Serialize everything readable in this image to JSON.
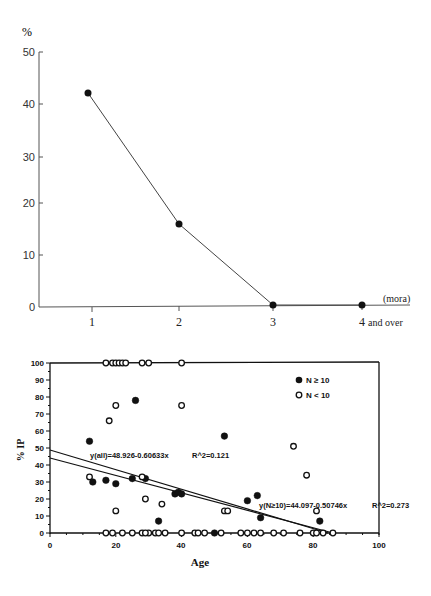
{
  "chart_data": [
    {
      "type": "line",
      "title": "",
      "xlabel": "(mora)",
      "ylabel": "%",
      "categories": [
        "1",
        "2",
        "3",
        "4 and over"
      ],
      "series": [
        {
          "name": "percentage",
          "values": [
            42,
            16,
            0,
            0
          ]
        }
      ],
      "ylim": [
        0,
        50
      ],
      "yticks": [
        "0",
        "10",
        "20",
        "30",
        "40",
        "50"
      ],
      "grid": false,
      "legend": null
    },
    {
      "type": "scatter",
      "title": "",
      "xlabel": "Age",
      "ylabel": "% IP",
      "xlim": [
        0,
        100
      ],
      "ylim": [
        0,
        100
      ],
      "xticks": [
        "0",
        "20",
        "40",
        "60",
        "80",
        "100"
      ],
      "yticks": [
        "0",
        "10",
        "20",
        "30",
        "40",
        "50",
        "60",
        "70",
        "80",
        "90",
        "100"
      ],
      "legend": {
        "position": "upper right",
        "entries": [
          "N ≥ 10",
          "N < 10"
        ]
      },
      "series": [
        {
          "name": "N ≥ 10",
          "marker": "filled-circle",
          "points": [
            [
              12,
              54
            ],
            [
              13,
              30
            ],
            [
              17,
              31
            ],
            [
              20,
              29
            ],
            [
              25,
              32
            ],
            [
              26,
              78
            ],
            [
              29,
              32
            ],
            [
              33,
              7
            ],
            [
              38,
              23
            ],
            [
              39,
              24
            ],
            [
              40,
              23
            ],
            [
              50,
              0
            ],
            [
              53,
              57
            ],
            [
              60,
              19
            ],
            [
              63,
              22
            ],
            [
              64,
              9
            ],
            [
              82,
              7
            ]
          ]
        },
        {
          "name": "N < 10",
          "marker": "open-circle",
          "points": [
            [
              12,
              33
            ],
            [
              17,
              100
            ],
            [
              18,
              66
            ],
            [
              19,
              100
            ],
            [
              20,
              100
            ],
            [
              20,
              75
            ],
            [
              21,
              100
            ],
            [
              22,
              100
            ],
            [
              23,
              100
            ],
            [
              28,
              100
            ],
            [
              28,
              33
            ],
            [
              29,
              20
            ],
            [
              30,
              100
            ],
            [
              30,
              0
            ],
            [
              20,
              13
            ],
            [
              34,
              17
            ],
            [
              40,
              75
            ],
            [
              40,
              100
            ],
            [
              17,
              0
            ],
            [
              19,
              0
            ],
            [
              22,
              0
            ],
            [
              25,
              0
            ],
            [
              28,
              0
            ],
            [
              29,
              0
            ],
            [
              32,
              0
            ],
            [
              33,
              0
            ],
            [
              35,
              0
            ],
            [
              40,
              0
            ],
            [
              44,
              0
            ],
            [
              45,
              0
            ],
            [
              47,
              0
            ],
            [
              52,
              0
            ],
            [
              53,
              13
            ],
            [
              54,
              13
            ],
            [
              58,
              0
            ],
            [
              60,
              0
            ],
            [
              62,
              0
            ],
            [
              64,
              0
            ],
            [
              68,
              0
            ],
            [
              71,
              0
            ],
            [
              74,
              51
            ],
            [
              76,
              0
            ],
            [
              78,
              34
            ],
            [
              80,
              0
            ],
            [
              81,
              13
            ],
            [
              81,
              0
            ],
            [
              83,
              0
            ],
            [
              86,
              0
            ]
          ]
        }
      ],
      "regressions": [
        {
          "label": "y(all)=48.926-0.60633x",
          "r2_label": "R^2=0.121",
          "intercept": 48.926,
          "slope": -0.60633
        },
        {
          "label": "y(N≥10)=44.097-0.50746x",
          "r2_label": "R^2=0.273",
          "intercept": 44.097,
          "slope": -0.50746
        }
      ]
    }
  ],
  "top_chart": {
    "y_unit": "%",
    "x_unit": "(mora)",
    "y_ticks": [
      "50",
      "40",
      "30",
      "20",
      "10",
      "0"
    ],
    "x_ticks": [
      "1",
      "2",
      "3",
      "4"
    ],
    "x_last_suffix": "and over"
  },
  "bottom_chart": {
    "ylabel": "% IP",
    "xlabel": "Age",
    "legend_filled": "N ≥ 10",
    "legend_open": "N < 10",
    "eq_all": "y(all)=48.926-0.60633x",
    "r2_all": "R^2=0.121",
    "eq_n10": "y(N≥10)=44.097-0.50746x",
    "r2_n10": "R^2=0.273",
    "y_ticks": [
      "100",
      "90",
      "80",
      "70",
      "60",
      "50",
      "40",
      "30",
      "20",
      "10",
      "0"
    ],
    "x_ticks": [
      "0",
      "20",
      "40",
      "60",
      "80",
      "100"
    ]
  }
}
